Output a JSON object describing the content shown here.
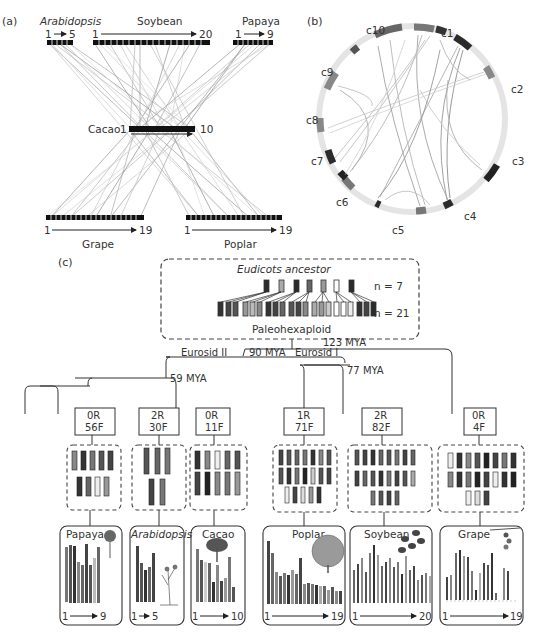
{
  "panel_a": {
    "label": "(a)",
    "top_genomes": [
      {
        "name": "Arabidopsis",
        "italic": true,
        "start": "1",
        "end": "5",
        "chromosomes": 5
      },
      {
        "name": "Soybean",
        "italic": false,
        "start": "1",
        "end": "20",
        "chromosomes": 20
      },
      {
        "name": "Papaya",
        "italic": false,
        "start": "1",
        "end": "9",
        "chromosomes": 9
      }
    ],
    "center_genome": {
      "name": "Cacao",
      "start": "1",
      "end": "10",
      "chromosomes": 10
    },
    "bottom_genomes": [
      {
        "name": "Grape",
        "start": "1",
        "end": "19",
        "chromosomes": 19
      },
      {
        "name": "Poplar",
        "start": "1",
        "end": "19",
        "chromosomes": 19
      }
    ]
  },
  "panel_b": {
    "label": "(b)",
    "chromosomes": [
      "c1",
      "c2",
      "c3",
      "c4",
      "c5",
      "c6",
      "c7",
      "c8",
      "c9",
      "c10"
    ]
  },
  "panel_c": {
    "label": "(c)",
    "ancestor": {
      "title": "Eudicots ancestor",
      "n_top": "n = 7",
      "n_bottom": "n = 21",
      "subtitle": "Paleohexaploid"
    },
    "divergences": {
      "root": "123 MYA",
      "eurosid_split": "90 MYA",
      "eurosid_ii": "Eurosid II",
      "eurosid_i": "Eurosid I",
      "eurosid_i_node": "77 MYA",
      "eurosid_ii_node": "59 MYA"
    },
    "lineages": [
      {
        "rearr": "0R",
        "fusions": "56F",
        "species": "Papaya",
        "italic": false,
        "start": "1",
        "end": "9"
      },
      {
        "rearr": "2R",
        "fusions": "30F",
        "species": "Arabidopsis",
        "italic": true,
        "start": "1",
        "end": "5"
      },
      {
        "rearr": "0R",
        "fusions": "11F",
        "species": "Cacao",
        "italic": false,
        "start": "1",
        "end": "10"
      },
      {
        "rearr": "1R",
        "fusions": "71F",
        "species": "Poplar",
        "italic": false,
        "start": "1",
        "end": "19"
      },
      {
        "rearr": "2R",
        "fusions": "82F",
        "species": "Soybean",
        "italic": false,
        "start": "1",
        "end": "20"
      },
      {
        "rearr": "0R",
        "fusions": "4F",
        "species": "Grape",
        "italic": false,
        "start": "1",
        "end": "19"
      }
    ]
  },
  "colors": {
    "ink": "#333333",
    "dark": "#2b2b2b",
    "mid": "#7a7a7a",
    "light": "#c8c8c8",
    "dashed_border": "#555555"
  }
}
